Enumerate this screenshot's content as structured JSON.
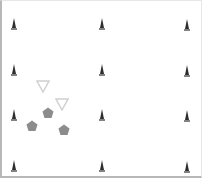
{
  "board": {
    "background": "#ffffff",
    "border_color": "#b8b8b8"
  },
  "pieces": {
    "cones": [
      {
        "x": 14,
        "y": 22
      },
      {
        "x": 102,
        "y": 22
      },
      {
        "x": 187,
        "y": 23
      },
      {
        "x": 14,
        "y": 68
      },
      {
        "x": 102,
        "y": 68
      },
      {
        "x": 187,
        "y": 69
      },
      {
        "x": 14,
        "y": 113
      },
      {
        "x": 102,
        "y": 113
      },
      {
        "x": 187,
        "y": 114
      },
      {
        "x": 14,
        "y": 164
      },
      {
        "x": 102,
        "y": 164
      },
      {
        "x": 187,
        "y": 165
      }
    ],
    "cone_color": "#2e2e2e",
    "triangles": [
      {
        "x": 43,
        "y": 86
      },
      {
        "x": 62,
        "y": 104
      }
    ],
    "triangle_stroke": "#cfcfcf",
    "pentagons": [
      {
        "x": 48,
        "y": 111
      },
      {
        "x": 32,
        "y": 124
      },
      {
        "x": 64,
        "y": 128
      }
    ],
    "pentagon_color": "#8c8c8c"
  }
}
